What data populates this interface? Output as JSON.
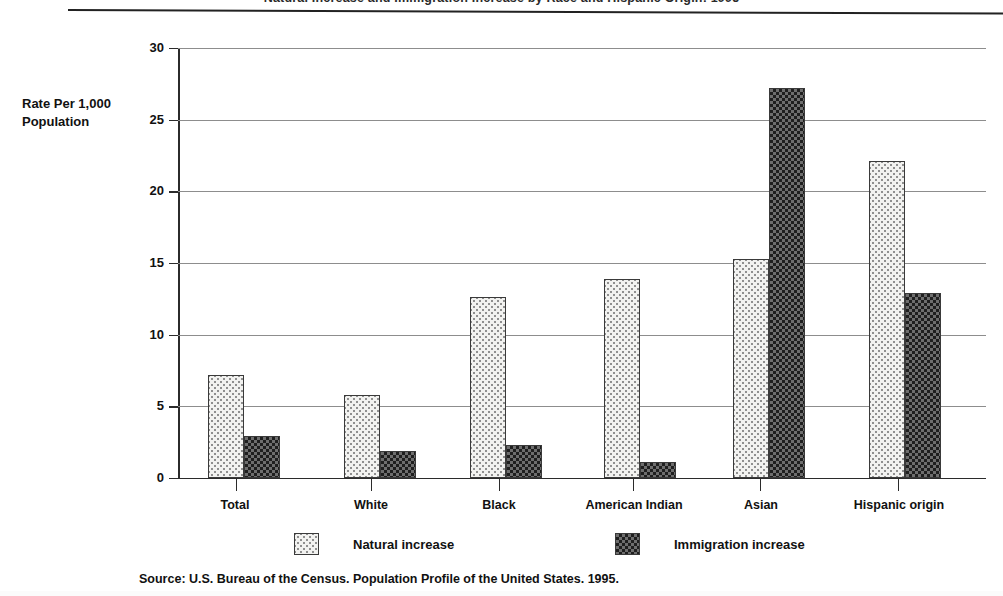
{
  "header": {
    "title_cropped": "Natural Increase and Immigration Increase by Race and Hispanic Origin: 1995"
  },
  "axis": {
    "y_title_line1": "Rate Per 1,000",
    "y_title_line2": "Population"
  },
  "legend": {
    "items": [
      {
        "label": "Natural increase",
        "pattern": "light-dotted",
        "color": "#f2f2f0"
      },
      {
        "label": "Immigration increase",
        "pattern": "dark-checkered",
        "color": "#5a5a5a"
      }
    ]
  },
  "source": {
    "text": "Source: U.S. Bureau of the Census. Population Profile of the United States. 1995."
  },
  "chart_data": {
    "type": "bar",
    "title": "Natural Increase and Immigration Increase by Race and Hispanic Origin: 1995",
    "xlabel": "",
    "ylabel": "Rate Per 1,000 Population",
    "ylim": [
      0,
      30
    ],
    "yticks": [
      0,
      5,
      10,
      15,
      20,
      25,
      30
    ],
    "ytick_labels": [
      "0",
      "5",
      "10",
      "15",
      "20",
      "25",
      "30"
    ],
    "grid": true,
    "legend_position": "bottom",
    "categories": [
      "Total",
      "White",
      "Black",
      "American Indian",
      "Asian",
      "Hispanic origin"
    ],
    "series": [
      {
        "name": "Natural increase",
        "values": [
          7.2,
          5.8,
          12.6,
          13.9,
          15.3,
          22.1
        ]
      },
      {
        "name": "Immigration increase",
        "values": [
          2.9,
          1.9,
          2.3,
          1.1,
          27.2,
          12.9
        ]
      }
    ]
  }
}
